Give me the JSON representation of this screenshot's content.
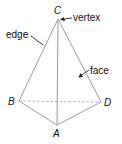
{
  "figure": {
    "type": "tetrahedron-diagram",
    "vertices": {
      "C": {
        "label": "C",
        "x": 58,
        "y": 19
      },
      "B": {
        "label": "B",
        "x": 19,
        "y": 101
      },
      "D": {
        "label": "D",
        "x": 101,
        "y": 102
      },
      "A": {
        "label": "A",
        "x": 57,
        "y": 125
      }
    },
    "edges_visible": [
      [
        "C",
        "B"
      ],
      [
        "C",
        "D"
      ],
      [
        "C",
        "A"
      ],
      [
        "B",
        "A"
      ],
      [
        "D",
        "A"
      ]
    ],
    "edges_hidden": [
      [
        "B",
        "D"
      ]
    ],
    "annotations": {
      "vertex": {
        "text": "vertex",
        "points_to": "C"
      },
      "edge": {
        "text": "edge",
        "points_to": "edge CB"
      },
      "face": {
        "text": "face",
        "points_to": "face ACD"
      }
    },
    "colors": {
      "edge": "#9a9a9a",
      "text": "#111111",
      "leader": "#222222",
      "background": "#ffffff"
    }
  }
}
